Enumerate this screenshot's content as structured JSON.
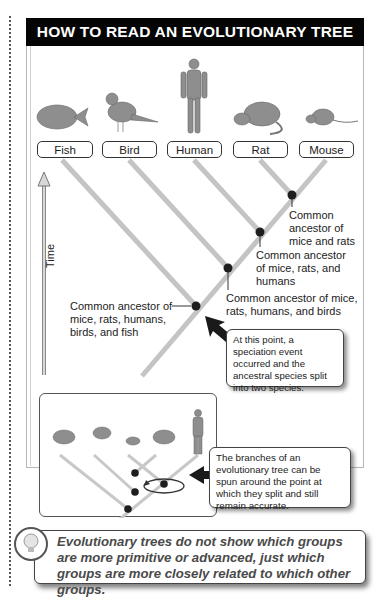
{
  "title": "HOW TO READ AN EVOLUTIONARY TREE",
  "taxa": [
    {
      "label": "Fish",
      "icon": "fish-icon"
    },
    {
      "label": "Bird",
      "icon": "bird-icon"
    },
    {
      "label": "Human",
      "icon": "human-icon"
    },
    {
      "label": "Rat",
      "icon": "rat-icon"
    },
    {
      "label": "Mouse",
      "icon": "mouse-icon"
    }
  ],
  "axis": {
    "label": "Time",
    "direction": "up"
  },
  "nodes": [
    {
      "id": "mice-rats",
      "label_lines": [
        "Common",
        "ancestor of",
        "mice and rats"
      ]
    },
    {
      "id": "mice-rats-humans",
      "label_lines": [
        "Common ancestor",
        "of mice, rats, and",
        "humans"
      ]
    },
    {
      "id": "mice-rats-humans-birds",
      "label_lines": [
        "Common ancestor of mice,",
        "rats, humans, and birds"
      ]
    },
    {
      "id": "all",
      "label_lines": [
        "Common ancestor of",
        "mice, rats, humans,",
        "birds, and fish"
      ]
    }
  ],
  "callouts": {
    "speciation": "At this point, a speciation event occurred and the ancestral species split into two species.",
    "rotation": "The branches of an evolutionary tree can be spun around the point at which they split and still remain accurate."
  },
  "inset": {
    "taxa_order": [
      "Fish",
      "Bird",
      "Mouse",
      "Rat",
      "Human"
    ]
  },
  "tip": {
    "text": "Evolutionary trees do not show which groups are more primitive or advanced, just which groups are more closely related to which other groups.",
    "icon": "lightbulb-icon"
  },
  "colors": {
    "header_bg": "#050505",
    "branch": "#c4c4c4",
    "node": "#1e1e1e",
    "arrow": "#1a1a1a"
  }
}
